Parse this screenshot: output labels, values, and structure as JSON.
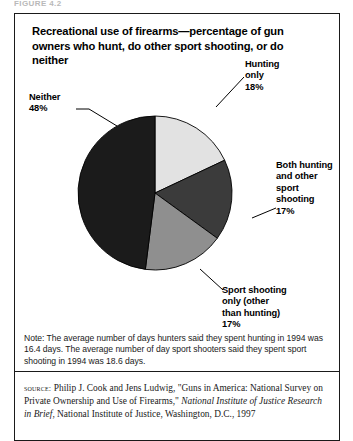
{
  "figure": {
    "header_strip": "FIGURE 4.2",
    "title": "Recreational use of firearms—percentage of gun owners who hunt, do other sport shooting, or do neither"
  },
  "chart_data": {
    "type": "pie",
    "title": "Recreational use of firearms—percentage of gun owners who hunt, do other sport shooting, or do neither",
    "unit": "percent",
    "start_angle_deg": 0,
    "direction": "clockwise",
    "legend_position": "callout-labels",
    "categories": [
      "Hunting only",
      "Both hunting and other sport shooting",
      "Sport shooting only (other than hunting)",
      "Neither"
    ],
    "values": [
      18,
      17,
      17,
      48
    ],
    "colors": [
      "#e2e2e2",
      "#3b3b3b",
      "#8f8f8f",
      "#1b1b1b"
    ],
    "slices": [
      {
        "name": "Hunting only",
        "label_lines": "Hunting\nonly\n18%",
        "value": 18,
        "color": "#e2e2e2",
        "start_deg": 0,
        "end_deg": 64.8
      },
      {
        "name": "Both hunting and other sport shooting",
        "label_lines": "Both hunting\nand other\nsport\nshooting\n17%",
        "value": 17,
        "color": "#3b3b3b",
        "start_deg": 64.8,
        "end_deg": 126.0
      },
      {
        "name": "Sport shooting only (other than hunting)",
        "label_lines": "Sport shooting\nonly (other\nthan hunting)\n17%",
        "value": 17,
        "color": "#8f8f8f",
        "start_deg": 126.0,
        "end_deg": 187.2
      },
      {
        "name": "Neither",
        "label_lines": "Neither\n48%",
        "value": 48,
        "color": "#1b1b1b",
        "start_deg": 187.2,
        "end_deg": 360.0
      }
    ]
  },
  "note": {
    "text": "Note: The average number of days hunters said they spent hunting in 1994 was 16.4 days. The average number of day sport shooters said they spent sport shooting in 1994 was 18.6 days."
  },
  "source": {
    "label": "SOURCE:",
    "part1": " Philip J. Cook and Jens Ludwig, \"Guns in America: National Survey on Private Ownership and Use of Firearms,\" ",
    "italic": "National Institute of Justice Research in Brief",
    "part2": ", National Institute of Justice, Washington, D.C., 1997"
  }
}
